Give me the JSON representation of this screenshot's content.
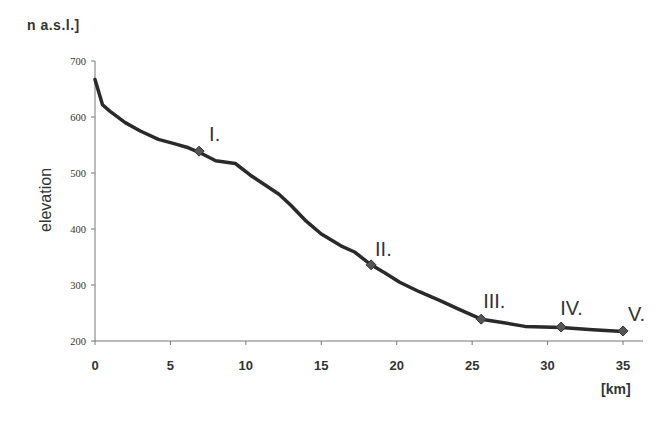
{
  "chart_data": {
    "type": "line",
    "title": "",
    "unit_label": "n a.s.l.]",
    "xlabel": "[km]",
    "ylabel": "elevation",
    "xlim": [
      0,
      35
    ],
    "ylim": [
      200,
      700
    ],
    "x_ticks": [
      "0",
      "5",
      "10",
      "15",
      "20",
      "25",
      "30",
      "35"
    ],
    "y_ticks": [
      "200",
      "300",
      "400",
      "500",
      "600",
      "700"
    ],
    "grid": false,
    "legend": null,
    "series": [
      {
        "name": "elevation profile",
        "color": "#2a2a2a",
        "points": [
          [
            0,
            667
          ],
          [
            0.5,
            622
          ],
          [
            1,
            610
          ],
          [
            2,
            590
          ],
          [
            3,
            575
          ],
          [
            4.2,
            560
          ],
          [
            5.3,
            552
          ],
          [
            6.2,
            545
          ],
          [
            6.9,
            537
          ],
          [
            8,
            522
          ],
          [
            9.3,
            517
          ],
          [
            10.3,
            496
          ],
          [
            11.3,
            478
          ],
          [
            12.2,
            462
          ],
          [
            13,
            442
          ],
          [
            14,
            414
          ],
          [
            15,
            391
          ],
          [
            16.3,
            370
          ],
          [
            17.2,
            359
          ],
          [
            18.3,
            336
          ],
          [
            19.2,
            322
          ],
          [
            20.2,
            305
          ],
          [
            21.5,
            288
          ],
          [
            22.8,
            273
          ],
          [
            24.1,
            257
          ],
          [
            25.6,
            239
          ],
          [
            27,
            233
          ],
          [
            28.5,
            226
          ],
          [
            30.9,
            224
          ],
          [
            33,
            220
          ],
          [
            35,
            217
          ]
        ]
      }
    ],
    "markers": [
      {
        "label": "I.",
        "x": 6.9,
        "y": 539
      },
      {
        "label": "II.",
        "x": 18.3,
        "y": 336
      },
      {
        "label": "III.",
        "x": 25.6,
        "y": 239
      },
      {
        "label": "IV.",
        "x": 30.9,
        "y": 225
      },
      {
        "label": "V.",
        "x": 35,
        "y": 218
      }
    ]
  }
}
